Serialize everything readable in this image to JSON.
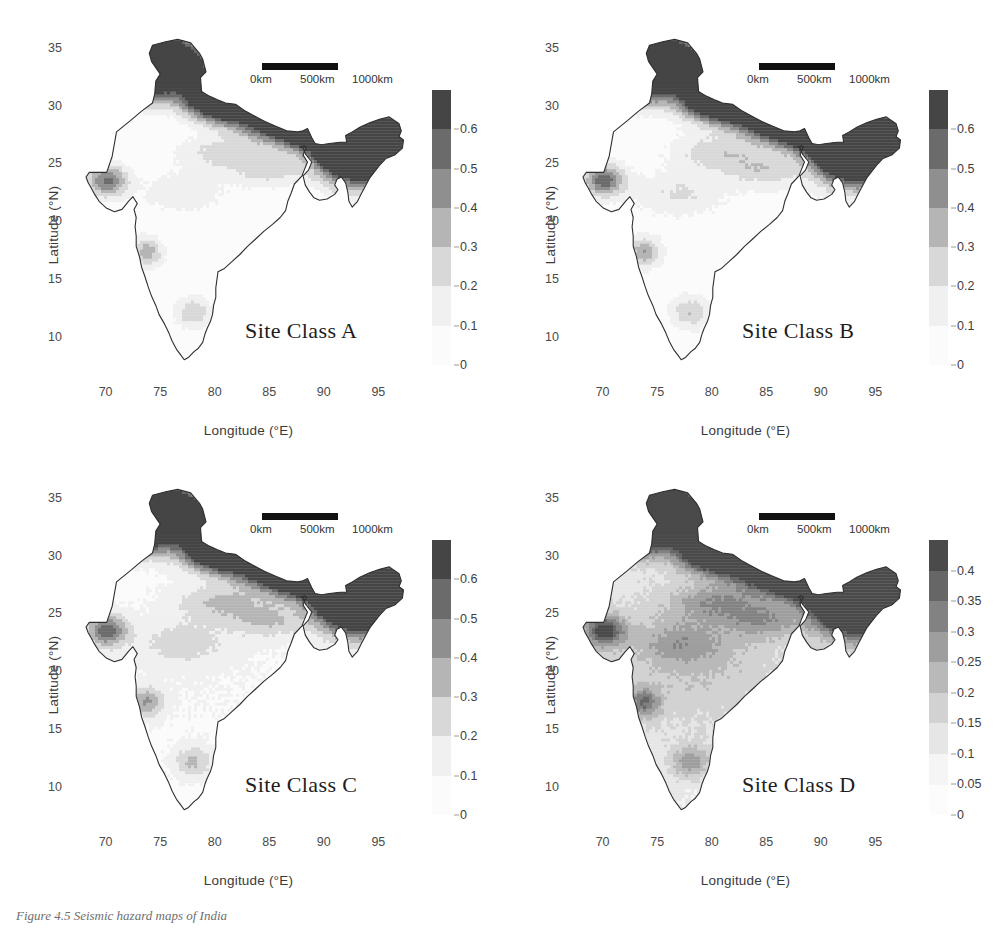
{
  "figure": {
    "caption": "Figure 4.5  Seismic hazard maps of India",
    "axes": {
      "xlabel": "Longitude (°E)",
      "ylabel": "Latitude (°N)",
      "xticks": [
        70,
        75,
        80,
        85,
        90,
        95
      ],
      "yticks": [
        10,
        15,
        20,
        25,
        30,
        35
      ],
      "xlim": [
        66,
        99
      ],
      "ylim": [
        6,
        38
      ]
    },
    "scalebar": {
      "label_0": "0km",
      "label_500": "500km",
      "label_1000": "1000km"
    },
    "palette": [
      "#ffffff",
      "#f2f2f2",
      "#dcdcdc",
      "#bfbfbf",
      "#9e9e9e",
      "#7d7d7d",
      "#5d5d5d",
      "#454545"
    ]
  },
  "chart_data": [
    {
      "type": "heatmap",
      "title": "Site Class A",
      "xlabel": "Longitude (°E)",
      "ylabel": "Latitude (°N)",
      "xlim": [
        66,
        99
      ],
      "ylim": [
        6,
        38
      ],
      "colorbar": {
        "ticks": [
          0,
          0.1,
          0.2,
          0.3,
          0.4,
          0.5,
          0.6
        ],
        "tick_labels": [
          "0",
          "0.1",
          "0.2",
          "0.3",
          "0.4",
          "0.5",
          "0.6"
        ],
        "vmin": 0,
        "vmax": 0.7,
        "units": "g"
      },
      "regions": [
        {
          "name": "Northeast India",
          "value": 0.65,
          "band": "0.6+"
        },
        {
          "name": "Kashmir / Western Himalaya",
          "value": 0.45,
          "band": "0.4-0.5"
        },
        {
          "name": "Central Himalaya",
          "value": 0.35,
          "band": "0.3-0.4"
        },
        {
          "name": "Kutch (Gujarat)",
          "value": 0.25,
          "band": "0.2-0.3"
        },
        {
          "name": "Indo-Gangetic Plain",
          "value": 0.12,
          "band": "0.1-0.2"
        },
        {
          "name": "Peninsular India (craton)",
          "value": 0.05,
          "band": "0-0.1"
        },
        {
          "name": "Western Ghats (Koyna)",
          "value": 0.18,
          "band": "0.1-0.2"
        },
        {
          "name": "Southern India",
          "value": 0.06,
          "band": "0-0.1"
        }
      ]
    },
    {
      "type": "heatmap",
      "title": "Site Class B",
      "xlabel": "Longitude (°E)",
      "ylabel": "Latitude (°N)",
      "xlim": [
        66,
        99
      ],
      "ylim": [
        6,
        38
      ],
      "colorbar": {
        "ticks": [
          0,
          0.1,
          0.2,
          0.3,
          0.4,
          0.5,
          0.6
        ],
        "tick_labels": [
          "0",
          "0.1",
          "0.2",
          "0.3",
          "0.4",
          "0.5",
          "0.6"
        ],
        "vmin": 0,
        "vmax": 0.7,
        "units": "g"
      },
      "regions": [
        {
          "name": "Northeast India",
          "value": 0.66,
          "band": "0.6+"
        },
        {
          "name": "Kashmir / Western Himalaya",
          "value": 0.47,
          "band": "0.4-0.5"
        },
        {
          "name": "Central Himalaya",
          "value": 0.37,
          "band": "0.3-0.4"
        },
        {
          "name": "Kutch (Gujarat)",
          "value": 0.27,
          "band": "0.2-0.3"
        },
        {
          "name": "Indo-Gangetic Plain",
          "value": 0.14,
          "band": "0.1-0.2"
        },
        {
          "name": "Peninsular India (craton)",
          "value": 0.06,
          "band": "0-0.1"
        },
        {
          "name": "Western Ghats (Koyna)",
          "value": 0.2,
          "band": "0.2-0.3"
        },
        {
          "name": "Southern India",
          "value": 0.07,
          "band": "0-0.1"
        }
      ]
    },
    {
      "type": "heatmap",
      "title": "Site Class C",
      "xlabel": "Longitude (°E)",
      "ylabel": "Latitude (°N)",
      "xlim": [
        66,
        99
      ],
      "ylim": [
        6,
        38
      ],
      "colorbar": {
        "ticks": [
          0,
          0.1,
          0.2,
          0.3,
          0.4,
          0.5,
          0.6
        ],
        "tick_labels": [
          "0",
          "0.1",
          "0.2",
          "0.3",
          "0.4",
          "0.5",
          "0.6"
        ],
        "vmin": 0,
        "vmax": 0.7,
        "units": "g"
      },
      "regions": [
        {
          "name": "Northeast India",
          "value": 0.6,
          "band": "0.5-0.6"
        },
        {
          "name": "Kashmir / Western Himalaya",
          "value": 0.44,
          "band": "0.4-0.5"
        },
        {
          "name": "Central Himalaya",
          "value": 0.36,
          "band": "0.3-0.4"
        },
        {
          "name": "Kutch (Gujarat)",
          "value": 0.28,
          "band": "0.2-0.3"
        },
        {
          "name": "Indo-Gangetic Plain",
          "value": 0.18,
          "band": "0.1-0.2"
        },
        {
          "name": "Peninsular India (craton)",
          "value": 0.08,
          "band": "0-0.1"
        },
        {
          "name": "Western Ghats (Koyna)",
          "value": 0.22,
          "band": "0.2-0.3"
        },
        {
          "name": "Southern India",
          "value": 0.12,
          "band": "0.1-0.2"
        }
      ]
    },
    {
      "type": "heatmap",
      "title": "Site Class D",
      "xlabel": "Longitude (°E)",
      "ylabel": "Latitude (°N)",
      "xlim": [
        66,
        99
      ],
      "ylim": [
        6,
        38
      ],
      "colorbar": {
        "ticks": [
          0,
          0.05,
          0.1,
          0.15,
          0.2,
          0.25,
          0.3,
          0.35,
          0.4
        ],
        "tick_labels": [
          "0",
          "0.05",
          "0.1",
          "0.15",
          "0.2",
          "0.25",
          "0.3",
          "0.35",
          "0.4"
        ],
        "vmin": 0,
        "vmax": 0.45,
        "units": "g"
      },
      "regions": [
        {
          "name": "Northeast India",
          "value": 0.33,
          "band": "0.3-0.35"
        },
        {
          "name": "Kashmir / Western Himalaya",
          "value": 0.3,
          "band": "0.3-0.35"
        },
        {
          "name": "Central Himalaya",
          "value": 0.27,
          "band": "0.25-0.3"
        },
        {
          "name": "Kutch (Gujarat)",
          "value": 0.24,
          "band": "0.2-0.25"
        },
        {
          "name": "Indo-Gangetic Plain",
          "value": 0.17,
          "band": "0.15-0.2"
        },
        {
          "name": "Peninsular India (craton)",
          "value": 0.12,
          "band": "0.1-0.15"
        },
        {
          "name": "Western Ghats (Koyna)",
          "value": 0.2,
          "band": "0.2-0.25"
        },
        {
          "name": "Southern India",
          "value": 0.15,
          "band": "0.1-0.15"
        }
      ]
    }
  ],
  "panels": [
    {
      "id": "a",
      "title": "Site Class A",
      "colorbar_ticks": [
        "0.6",
        "0.5",
        "0.4",
        "0.3",
        "0.2",
        "0.1",
        "0"
      ],
      "colorbar_cells": [
        "#454545",
        "#6b6b6b",
        "#8f8f8f",
        "#b5b5b5",
        "#d8d8d8",
        "#f0f0f0",
        "#fbfbfb"
      ],
      "intensity": "high"
    },
    {
      "id": "b",
      "title": "Site Class B",
      "colorbar_ticks": [
        "0.6",
        "0.5",
        "0.4",
        "0.3",
        "0.2",
        "0.1",
        "0"
      ],
      "colorbar_cells": [
        "#454545",
        "#6b6b6b",
        "#8f8f8f",
        "#b5b5b5",
        "#d8d8d8",
        "#f0f0f0",
        "#fbfbfb"
      ],
      "intensity": "high"
    },
    {
      "id": "c",
      "title": "Site Class C",
      "colorbar_ticks": [
        "0.6",
        "0.5",
        "0.4",
        "0.3",
        "0.2",
        "0.1",
        "0"
      ],
      "colorbar_cells": [
        "#454545",
        "#6b6b6b",
        "#8f8f8f",
        "#b5b5b5",
        "#d8d8d8",
        "#f0f0f0",
        "#fbfbfb"
      ],
      "intensity": "medium"
    },
    {
      "id": "d",
      "title": "Site Class D",
      "colorbar_ticks": [
        "0.4",
        "0.35",
        "0.3",
        "0.25",
        "0.2",
        "0.15",
        "0.1",
        "0.05",
        "0"
      ],
      "colorbar_cells": [
        "#4a4a4a",
        "#666666",
        "#828282",
        "#9e9e9e",
        "#b9b9b9",
        "#d2d2d2",
        "#e6e6e6",
        "#f5f5f5",
        "#fcfcfc"
      ],
      "intensity": "low"
    }
  ]
}
